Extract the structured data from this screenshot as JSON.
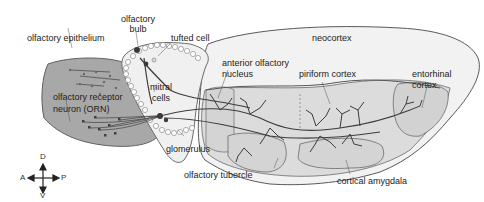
{
  "diagram": {
    "type": "anatomical-diagram",
    "colors": {
      "background": "#ffffff",
      "epithelium_fill": "#a8a8a8",
      "brain_fill": "#ececec",
      "region_fill": "#d9d9d9",
      "neocortex_fill": "#f4f4f4",
      "outline": "#5a5a5a",
      "neuron": "#3c3c3c"
    },
    "labels": {
      "olfactory_epithelium": "olfactory epithelium",
      "olfactory_bulb_line1": "olfactory",
      "olfactory_bulb_line2": "bulb",
      "tufted_cell": "tufted cell",
      "neocortex": "neocortex",
      "anterior_olfactory_nucleus_line1": "anterior olfactory",
      "anterior_olfactory_nucleus_line2": "nucleus",
      "piriform_cortex": "piriform cortex",
      "entorhinal_cortex_line1": "entorhinal",
      "entorhinal_cortex_line2": "cortex",
      "mitral_cells_line1": "mitral",
      "mitral_cells_line2": "cells",
      "orn_line1": "olfactory receptor",
      "orn_line2": "neuron (ORN)",
      "glomerulus": "glomerulus",
      "olfactory_tubercle": "olfactory tubercle",
      "cortical_amygdala": "cortical amygdala"
    },
    "compass": {
      "dorsal": "D",
      "ventral": "V",
      "anterior": "A",
      "posterior": "P"
    }
  }
}
